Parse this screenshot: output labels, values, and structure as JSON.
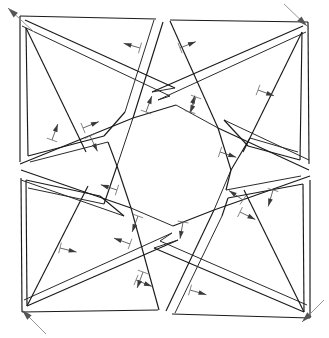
{
  "figure": {
    "type": "geometric-diagram",
    "width": 329,
    "height": 338,
    "background_color": "#ffffff",
    "line_color": "#1a1a1a",
    "arrow_color": "#3a3a3a",
    "corner_arrow_color": "#555555",
    "symmetry": "4-fold rotational (C4) pinwheel",
    "central_void": "octagon",
    "strip_count": 8
  },
  "geometry": {
    "outer_frame": {
      "top_left": [
        20,
        16
      ],
      "top_right": [
        308,
        22
      ],
      "bottom_right": [
        310,
        318
      ],
      "bottom_left": [
        22,
        312
      ],
      "edge_gaps": {
        "top": [
          155,
          168
        ],
        "right": [
          166,
          178
        ],
        "bottom": [
          158,
          172
        ],
        "left": [
          160,
          176
        ]
      }
    },
    "band_width": 9,
    "central_octagon": [
      [
        133,
        118
      ],
      [
        176,
        105
      ],
      [
        218,
        128
      ],
      [
        231,
        170
      ],
      [
        214,
        210
      ],
      [
        173,
        226
      ],
      [
        131,
        208
      ],
      [
        117,
        166
      ]
    ]
  },
  "corner_arrows": [
    {
      "name": "top-left-outward",
      "from": [
        34,
        32
      ],
      "to": [
        8,
        8
      ],
      "direction": "up-left"
    },
    {
      "name": "top-right-inward",
      "from": [
        284,
        4
      ],
      "to": [
        307,
        26
      ],
      "direction": "down-right"
    },
    {
      "name": "bottom-left-inward",
      "from": [
        46,
        334
      ],
      "to": [
        22,
        310
      ],
      "direction": "up-left"
    },
    {
      "name": "bottom-right-inward",
      "from": [
        324,
        300
      ],
      "to": [
        302,
        322
      ],
      "direction": "down-left"
    }
  ],
  "normal_arrows": [
    {
      "name": "arrow-top-inner-left",
      "x": 140,
      "y": 48,
      "angle": 196
    },
    {
      "name": "arrow-top-inner-right",
      "x": 180,
      "y": 48,
      "angle": 338
    },
    {
      "name": "arrow-upper-right-a",
      "x": 196,
      "y": 97,
      "angle": 110
    },
    {
      "name": "arrow-upper-right-b",
      "x": 258,
      "y": 90,
      "angle": 20
    },
    {
      "name": "arrow-left-upper",
      "x": 83,
      "y": 128,
      "angle": 338
    },
    {
      "name": "arrow-left-mid",
      "x": 52,
      "y": 140,
      "angle": 290
    },
    {
      "name": "arrow-left-mid-b",
      "x": 90,
      "y": 136,
      "angle": 64
    },
    {
      "name": "arrow-center-upper-l",
      "x": 146,
      "y": 112,
      "angle": 290
    },
    {
      "name": "arrow-center-upper-r",
      "x": 190,
      "y": 112,
      "angle": 286
    },
    {
      "name": "arrow-center-right",
      "x": 220,
      "y": 152,
      "angle": 18
    },
    {
      "name": "arrow-center-left",
      "x": 117,
      "y": 190,
      "angle": 198
    },
    {
      "name": "arrow-center-lower-l",
      "x": 138,
      "y": 216,
      "angle": 110
    },
    {
      "name": "arrow-center-lower-r",
      "x": 183,
      "y": 222,
      "angle": 100
    },
    {
      "name": "arrow-right-mid",
      "x": 243,
      "y": 200,
      "angle": 214
    },
    {
      "name": "arrow-right-lower",
      "x": 273,
      "y": 190,
      "angle": 106
    },
    {
      "name": "arrow-lower-right",
      "x": 240,
      "y": 212,
      "angle": 26
    },
    {
      "name": "arrow-lower-left-a",
      "x": 60,
      "y": 248,
      "angle": 14
    },
    {
      "name": "arrow-lower-left-b",
      "x": 130,
      "y": 244,
      "angle": 200
    },
    {
      "name": "arrow-bottom-inner-l",
      "x": 136,
      "y": 280,
      "angle": 22
    },
    {
      "name": "arrow-bottom-inner-r",
      "x": 190,
      "y": 290,
      "angle": 16
    },
    {
      "name": "arrow-bottom-mid",
      "x": 143,
      "y": 272,
      "angle": 110
    }
  ]
}
